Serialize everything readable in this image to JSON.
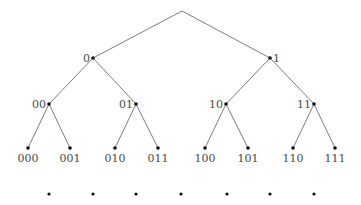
{
  "diagram": {
    "type": "binary-tree",
    "root": {
      "x": 182,
      "y": 11,
      "label": ""
    },
    "levels": [
      {
        "depth": 1,
        "nodes": [
          {
            "label": "0",
            "x": 93,
            "y": 58,
            "label_side": "left"
          },
          {
            "label": "1",
            "x": 270,
            "y": 58,
            "label_side": "right"
          }
        ]
      },
      {
        "depth": 2,
        "nodes": [
          {
            "label": "00",
            "x": 49,
            "y": 104,
            "label_side": "left"
          },
          {
            "label": "01",
            "x": 136,
            "y": 104,
            "label_side": "left"
          },
          {
            "label": "10",
            "x": 226,
            "y": 104,
            "label_side": "left"
          },
          {
            "label": "11",
            "x": 314,
            "y": 104,
            "label_side": "left"
          }
        ]
      },
      {
        "depth": 3,
        "nodes": [
          {
            "label": "000",
            "x": 28,
            "y": 148,
            "label_side": "below"
          },
          {
            "label": "001",
            "x": 70,
            "y": 148,
            "label_side": "below"
          },
          {
            "label": "010",
            "x": 115,
            "y": 148,
            "label_side": "below"
          },
          {
            "label": "011",
            "x": 158,
            "y": 148,
            "label_side": "below"
          },
          {
            "label": "100",
            "x": 205,
            "y": 148,
            "label_side": "below"
          },
          {
            "label": "101",
            "x": 248,
            "y": 148,
            "label_side": "below"
          },
          {
            "label": "110",
            "x": 293,
            "y": 148,
            "label_side": "below"
          },
          {
            "label": "111",
            "x": 335,
            "y": 148,
            "label_side": "below"
          }
        ]
      }
    ],
    "edges": [
      [
        "root",
        "0"
      ],
      [
        "root",
        "1"
      ],
      [
        "0",
        "00"
      ],
      [
        "0",
        "01"
      ],
      [
        "1",
        "10"
      ],
      [
        "1",
        "11"
      ],
      [
        "00",
        "000"
      ],
      [
        "00",
        "001"
      ],
      [
        "01",
        "010"
      ],
      [
        "01",
        "011"
      ],
      [
        "10",
        "100"
      ],
      [
        "10",
        "101"
      ],
      [
        "11",
        "110"
      ],
      [
        "11",
        "111"
      ]
    ],
    "continuation_dots": [
      {
        "x": 49,
        "y": 194
      },
      {
        "x": 93,
        "y": 194
      },
      {
        "x": 136,
        "y": 194
      },
      {
        "x": 181,
        "y": 194
      },
      {
        "x": 227,
        "y": 194
      },
      {
        "x": 270,
        "y": 194
      },
      {
        "x": 314,
        "y": 194
      }
    ],
    "colors": {
      "edge": "#6e6e6e",
      "node": "#111111",
      "label": "#4a4a4a",
      "background": "#ffffff"
    }
  }
}
